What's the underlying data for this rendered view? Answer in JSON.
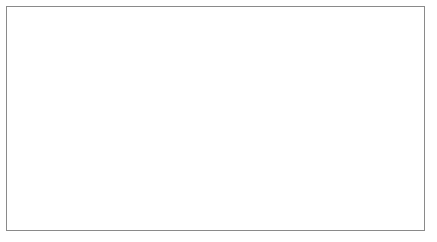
{
  "chart_data": {
    "type": "line",
    "title": "",
    "xlabel": "Year",
    "ylabel": "Wages ($/hour)",
    "xlim": [
      1960,
      2004
    ],
    "ylim": [
      0,
      18
    ],
    "grid": false,
    "legend_position": "inline-right",
    "y_ticks": [
      0,
      2,
      4,
      6,
      8,
      10,
      12,
      14,
      16,
      18
    ],
    "y_tick_labels": [
      "0",
      "2",
      "4",
      "6",
      "8",
      "10",
      "12",
      "14",
      "16",
      "18"
    ],
    "x_ticks": [
      1960,
      1965,
      1970,
      1975,
      1980,
      1985,
      1990,
      1995,
      2000,
      2004
    ],
    "x_tick_labels": [
      "1960",
      "1965",
      "1970",
      "1975",
      "1980",
      "1985",
      "1990",
      "1995",
      "2000",
      "2004"
    ],
    "x_minor_ticks": [
      1962.5,
      1967.5,
      1972.5,
      1977.5,
      1982.5,
      1987.5,
      1992.5,
      1997.5,
      2002
    ],
    "series": [
      {
        "name": "Nominal wage",
        "color": "#1a1a1a",
        "label_x": 1995.5,
        "label_y": 16.6,
        "x": [
          1960,
          1962,
          1964,
          1966,
          1968,
          1970,
          1972,
          1974,
          1976,
          1978,
          1980,
          1982,
          1984,
          1986,
          1988,
          1990,
          1992,
          1994,
          1996,
          1998,
          2000,
          2002,
          2004
        ],
        "values": [
          2.1,
          2.2,
          2.4,
          2.6,
          2.9,
          3.3,
          3.8,
          4.3,
          4.9,
          5.7,
          6.8,
          7.9,
          8.9,
          9.4,
          9.9,
          10.5,
          11.1,
          11.7,
          12.4,
          13.3,
          14.1,
          14.9,
          15.5
        ]
      },
      {
        "name": "Real wage",
        "color": "#6f6f6f",
        "label_x": 1993.5,
        "label_y": 6.6,
        "x": [
          1960,
          1962,
          1964,
          1966,
          1968,
          1970,
          1972,
          1973,
          1974,
          1976,
          1978,
          1979,
          1980,
          1982,
          1984,
          1986,
          1988,
          1990,
          1992,
          1994,
          1996,
          1998,
          2000,
          2002,
          2004
        ],
        "values": [
          7.3,
          7.5,
          7.7,
          7.9,
          8.1,
          8.2,
          8.3,
          8.8,
          8.5,
          8.7,
          9.0,
          9.1,
          8.8,
          8.5,
          8.4,
          8.2,
          8.1,
          8.1,
          8.1,
          8.1,
          8.2,
          8.3,
          8.4,
          8.4,
          8.4
        ]
      }
    ]
  }
}
